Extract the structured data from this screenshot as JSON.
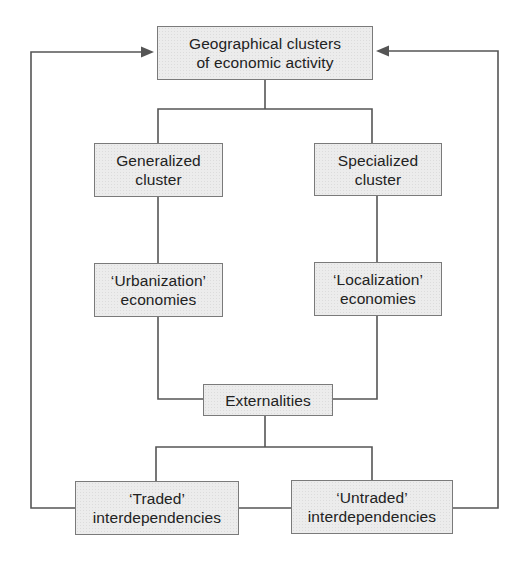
{
  "diagram": {
    "type": "flowchart",
    "colors": {
      "box_fill": "#ececec",
      "box_border": "#7a7a7a",
      "text": "#222222",
      "line": "#555555",
      "background": "#ffffff"
    },
    "nodes": {
      "clusters": {
        "line1": "Geographical clusters",
        "line2": "of economic activity"
      },
      "generalized": {
        "line1": "Generalized",
        "line2": "cluster"
      },
      "specialized": {
        "line1": "Specialized",
        "line2": "cluster"
      },
      "urbanization": {
        "line1": "‘Urbanization’",
        "line2": "economies"
      },
      "localization": {
        "line1": "‘Localization’",
        "line2": "economies"
      },
      "externalities": {
        "line1": "Externalities"
      },
      "traded": {
        "line1": "‘Traded’",
        "line2": "interdependencies"
      },
      "untraded": {
        "line1": "‘Untraded’",
        "line2": "interdependencies"
      }
    },
    "edges": [
      {
        "from": "clusters",
        "to": "generalized",
        "type": "line"
      },
      {
        "from": "clusters",
        "to": "specialized",
        "type": "line"
      },
      {
        "from": "generalized",
        "to": "urbanization",
        "type": "line"
      },
      {
        "from": "specialized",
        "to": "localization",
        "type": "line"
      },
      {
        "from": "urbanization",
        "to": "externalities",
        "type": "line"
      },
      {
        "from": "localization",
        "to": "externalities",
        "type": "line"
      },
      {
        "from": "externalities",
        "to": "traded",
        "type": "line"
      },
      {
        "from": "externalities",
        "to": "untraded",
        "type": "line"
      },
      {
        "from": "traded",
        "to": "untraded",
        "type": "line"
      },
      {
        "from": "traded",
        "to": "clusters",
        "type": "arrow"
      },
      {
        "from": "untraded",
        "to": "clusters",
        "type": "arrow"
      }
    ]
  }
}
